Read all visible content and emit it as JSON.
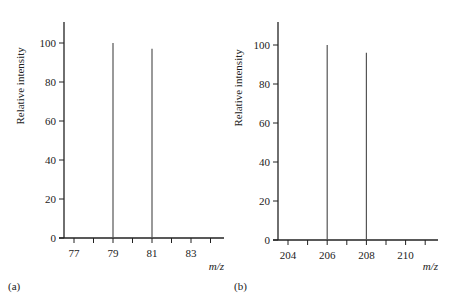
{
  "chart_data": [
    {
      "type": "bar",
      "subtype": "mass-spectrum-stick",
      "panel_label": "(a)",
      "title": "",
      "xlabel": "m/z",
      "ylabel": "Relative intensity",
      "x_ticks": [
        77,
        78,
        79,
        80,
        81,
        82,
        83,
        84
      ],
      "x_tick_labels": [
        "77",
        "79",
        "81",
        "83"
      ],
      "y_ticks": [
        0,
        20,
        40,
        60,
        80,
        100
      ],
      "xlim": [
        76.5,
        84.7
      ],
      "ylim": [
        0,
        110
      ],
      "grid": false,
      "legend": null,
      "x": [
        79,
        81
      ],
      "values": [
        100,
        97
      ]
    },
    {
      "type": "bar",
      "subtype": "mass-spectrum-stick",
      "panel_label": "(b)",
      "title": "",
      "xlabel": "m/z",
      "ylabel": "Relative intensity",
      "x_ticks": [
        204,
        205,
        206,
        207,
        208,
        209,
        210,
        211
      ],
      "x_tick_labels": [
        "204",
        "206",
        "208",
        "210"
      ],
      "y_ticks": [
        0,
        20,
        40,
        60,
        80,
        100
      ],
      "xlim": [
        203.5,
        211.6
      ],
      "ylim": [
        0,
        110
      ],
      "grid": false,
      "legend": null,
      "x": [
        206,
        208
      ],
      "values": [
        100,
        96
      ]
    }
  ],
  "labels": {
    "ylabel": "Relative intensity",
    "xlabel": "m/z",
    "panel_a": "(a)",
    "panel_b": "(b)"
  },
  "colors": {
    "axis": "#222222",
    "stick": "#555555"
  }
}
